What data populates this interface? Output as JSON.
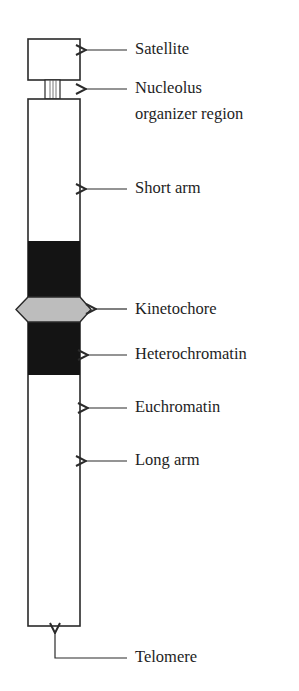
{
  "diagram": {
    "title": "",
    "colors": {
      "outline": "#2a2a2a",
      "heterochromatin": "#141414",
      "kinetochore": "#bdbdbd",
      "background": "#ffffff"
    },
    "labels": {
      "satellite": "Satellite",
      "nor_line1": "Nucleolus",
      "nor_line2": "organizer region",
      "short_arm": "Short arm",
      "kinetochore": "Kinetochore",
      "heterochromatin": "Heterochromatin",
      "euchromatin": "Euchromatin",
      "long_arm": "Long arm",
      "telomere": "Telomere"
    }
  }
}
